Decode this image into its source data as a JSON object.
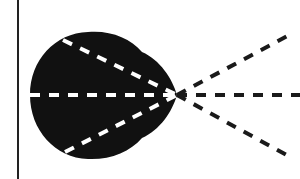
{
  "diagram": {
    "colors": {
      "background": "#ffffff",
      "body": "#111111",
      "inner_rays": "#ffffff",
      "outer_rays": "#1a1a1a",
      "boundary_line": "#222222"
    },
    "boundary_line": {
      "x": 18,
      "y1": 0,
      "y2": 179
    },
    "focal_point": {
      "x": 177,
      "y": 95
    },
    "inner_rays": [
      {
        "name": "upper",
        "from": [
          63,
          40
        ],
        "to": [
          177,
          95
        ]
      },
      {
        "name": "middle",
        "from": [
          30,
          95
        ],
        "to": [
          177,
          95
        ]
      },
      {
        "name": "lower",
        "from": [
          65,
          152
        ],
        "to": [
          177,
          95
        ]
      }
    ],
    "outer_rays": [
      {
        "name": "upper",
        "from": [
          177,
          95
        ],
        "to": [
          293,
          33
        ]
      },
      {
        "name": "middle",
        "from": [
          177,
          95
        ],
        "to": [
          300,
          95
        ]
      },
      {
        "name": "lower",
        "from": [
          177,
          95
        ],
        "to": [
          292,
          158
        ]
      }
    ]
  }
}
